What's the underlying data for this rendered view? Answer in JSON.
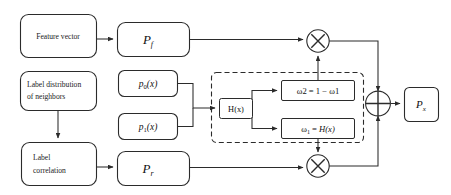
{
  "diagram": {
    "nodes": {
      "feature_vector": {
        "label": "Feature vector"
      },
      "label_distribution": {
        "line1": "Label distribution",
        "line2": "of neighbors"
      },
      "label_correlation": {
        "line1": "Label",
        "line2": "correlation"
      },
      "pf": {
        "base": "P",
        "sub": "f"
      },
      "pr": {
        "base": "P",
        "sub": "r"
      },
      "px": {
        "base": "P",
        "sub": "x"
      },
      "p0": {
        "base": "p",
        "sub": "0",
        "arg": "(x)"
      },
      "p1": {
        "base": "p",
        "sub": "1",
        "arg": "(x)"
      },
      "hx": {
        "label": "H(x)"
      },
      "omega2": {
        "text": "ω2 = 1 − ω1"
      },
      "omega1": {
        "prefix": "ω",
        "sub": "1",
        "eq": " = ",
        "func": "H(x)"
      }
    },
    "operators": {
      "multiply_top": {
        "symbol": "⊗",
        "name": "multiply"
      },
      "multiply_bottom": {
        "symbol": "⊗",
        "name": "multiply"
      },
      "add": {
        "symbol": "⊕",
        "name": "add"
      }
    },
    "colors": {
      "stroke": "#2b2b2b",
      "text": "#111111",
      "background": "#ffffff"
    }
  }
}
